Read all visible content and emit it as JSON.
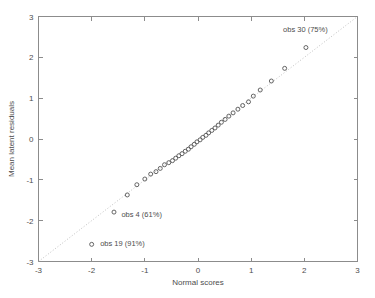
{
  "chart_data": {
    "type": "scatter",
    "title": "",
    "xlabel": "Normal scores",
    "ylabel": "Mean latent residuals",
    "xlim": [
      -3,
      3
    ],
    "ylim": [
      -3,
      3
    ],
    "xticks": [
      -3,
      -2,
      -1,
      0,
      1,
      2,
      3
    ],
    "yticks": [
      -3,
      -2,
      -1,
      0,
      1,
      2,
      3
    ],
    "xticklabels": [
      "-3",
      "-2",
      "-1",
      "0",
      "1",
      "2",
      "3"
    ],
    "yticklabels": [
      "-3",
      "-2",
      "-1",
      "0",
      "1",
      "2",
      "3"
    ],
    "grid": false,
    "legend": null,
    "reference_line": {
      "style": "dotted",
      "from": [
        -3,
        -3
      ],
      "to": [
        3,
        3
      ],
      "color": "#b0b0b0"
    },
    "marker_style": {
      "shape": "open-circle",
      "color": "#555555",
      "size": 4
    },
    "points": [
      [
        -2.0,
        -2.58
      ],
      [
        -1.58,
        -1.79
      ],
      [
        -1.33,
        -1.37
      ],
      [
        -1.15,
        -1.12
      ],
      [
        -1.0,
        -0.98
      ],
      [
        -0.89,
        -0.86
      ],
      [
        -0.79,
        -0.8
      ],
      [
        -0.71,
        -0.72
      ],
      [
        -0.63,
        -0.63
      ],
      [
        -0.55,
        -0.58
      ],
      [
        -0.48,
        -0.53
      ],
      [
        -0.42,
        -0.47
      ],
      [
        -0.36,
        -0.41
      ],
      [
        -0.3,
        -0.36
      ],
      [
        -0.24,
        -0.3
      ],
      [
        -0.18,
        -0.25
      ],
      [
        -0.13,
        -0.19
      ],
      [
        -0.07,
        -0.13
      ],
      [
        -0.02,
        -0.07
      ],
      [
        0.04,
        -0.02
      ],
      [
        0.09,
        0.04
      ],
      [
        0.15,
        0.09
      ],
      [
        0.2,
        0.15
      ],
      [
        0.26,
        0.21
      ],
      [
        0.32,
        0.27
      ],
      [
        0.38,
        0.34
      ],
      [
        0.44,
        0.41
      ],
      [
        0.51,
        0.48
      ],
      [
        0.58,
        0.56
      ],
      [
        0.66,
        0.64
      ],
      [
        0.75,
        0.73
      ],
      [
        0.84,
        0.82
      ],
      [
        0.95,
        0.91
      ],
      [
        1.04,
        1.05
      ],
      [
        1.17,
        1.2
      ],
      [
        1.38,
        1.42
      ],
      [
        1.63,
        1.73
      ],
      [
        2.03,
        2.24
      ]
    ],
    "annotations": [
      {
        "label": "obs 30 (75%)",
        "point": [
          2.03,
          2.24
        ],
        "text_x": 2.02,
        "text_y": 2.62,
        "anchor": "middle"
      },
      {
        "label": "obs 4 (61%)",
        "point": [
          -1.58,
          -1.79
        ],
        "text_x": -1.44,
        "text_y": -1.92,
        "anchor": "start"
      },
      {
        "label": "obs 19 (91%)",
        "point": [
          -2.0,
          -2.58
        ],
        "text_x": -1.84,
        "text_y": -2.62,
        "anchor": "start"
      }
    ]
  },
  "colors": {
    "background": "#ffffff",
    "axis": "#8c8c8c",
    "text": "#4d4d4d",
    "marker": "#555555",
    "reference_line": "#b0b0b0"
  }
}
